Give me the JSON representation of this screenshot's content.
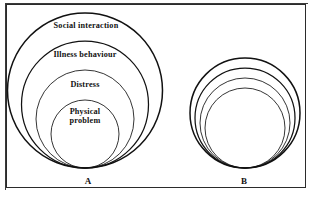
{
  "figure": {
    "background_color": "#ffffff",
    "stroke_color": "#111111",
    "frame": {
      "x": 6,
      "y": 4,
      "width": 300,
      "height": 184
    }
  },
  "chart_data": {
    "type": "diagram",
    "subtype": "nested-concentric-circles",
    "title": "",
    "panels": [
      {
        "id": "A",
        "label": "A",
        "label_x": 88,
        "label_y": 176,
        "center_x": 85,
        "tangent_y": 168,
        "rings": [
          {
            "name": "social-interaction",
            "label": "Social interaction",
            "radius": 77.5,
            "stroke_width": 1.5,
            "label_x": 86,
            "label_y": 22,
            "font_size": 8.2
          },
          {
            "name": "illness-behaviour",
            "label": "Illness behaviour",
            "radius": 63.5,
            "stroke_width": 1.25,
            "label_x": 85,
            "label_y": 51,
            "font_size": 8.2
          },
          {
            "name": "distress",
            "label": "Distress",
            "radius": 49,
            "stroke_width": 0.85,
            "label_x": 85,
            "label_y": 81,
            "font_size": 8.2
          },
          {
            "name": "physical-problem",
            "label": "Physical\nproblem",
            "radius": 34,
            "stroke_width": 0.85,
            "label_x": 85,
            "label_y": 108,
            "font_size": 8.2
          }
        ]
      },
      {
        "id": "B",
        "label": "B",
        "label_x": 244,
        "label_y": 176,
        "center_x": 245,
        "tangent_y": 168,
        "rings": [
          {
            "name": "social-interaction",
            "label": "",
            "radius": 55,
            "stroke_width": 1.5
          },
          {
            "name": "illness-behaviour",
            "label": "",
            "radius": 50,
            "stroke_width": 1.25
          },
          {
            "name": "distress",
            "label": "",
            "radius": 45,
            "stroke_width": 0.85
          },
          {
            "name": "physical-problem",
            "label": "",
            "radius": 40,
            "stroke_width": 0.85
          }
        ]
      }
    ]
  }
}
